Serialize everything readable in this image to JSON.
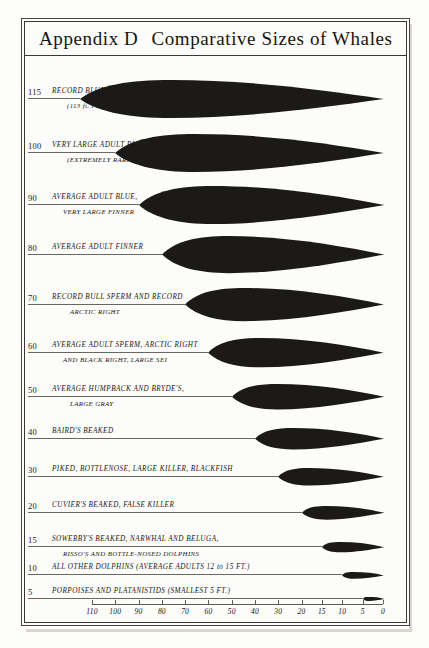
{
  "title": {
    "appendix": "Appendix D",
    "main": "Comparative Sizes of Whales"
  },
  "axis": {
    "ticks": [
      110,
      100,
      90,
      80,
      70,
      60,
      50,
      40,
      30,
      20,
      15,
      10,
      5,
      0
    ],
    "tick_labels": [
      "110",
      "100",
      "90",
      "80",
      "70",
      "60",
      "50",
      "40",
      "30",
      "20",
      "15",
      "10",
      "5",
      "0"
    ],
    "unit": "feet",
    "direction": "decreasing-left-to-right"
  },
  "chart_data": {
    "type": "bar",
    "xlabel": "",
    "ylabel": "",
    "orientation": "horizontal",
    "xlim": [
      120,
      0
    ],
    "grid": false,
    "legend": null,
    "note": "Horizontal whale silhouettes drawn to scale; each bar's length equals the animal's length in feet, aligned at the 0 ft right edge.",
    "categories": [
      "Record Blue",
      "Very Large Adult Blue",
      "Average Adult Blue, Very Large Finner",
      "Average Adult Finner",
      "Record Bull Sperm and Record Arctic Right",
      "Average Adult Sperm, Arctic Right and Black Right, Large Sei",
      "Average Humpback and Bryde's, Large Gray",
      "Baird's Beaked",
      "Piked, Bottlenose, Large Killer, Blackfish",
      "Cuvier's Beaked, False Killer",
      "Sowerby's Beaked, Narwhal and Beluga, Risso's and Bottle-nosed Dolphins",
      "All Other Dolphins",
      "Porpoises and Platanistids"
    ],
    "values": [
      115,
      100,
      90,
      80,
      70,
      60,
      50,
      40,
      30,
      20,
      15,
      10,
      5
    ],
    "rows": [
      {
        "value": 115,
        "tick": "115",
        "label_line1": "RECORD BLUE",
        "label_line2": "(113 ft. FEMALE)"
      },
      {
        "value": 100,
        "tick": "100",
        "label_line1": "VERY LARGE ADULT BLUE",
        "label_line2": "(EXTREMELY RARE)"
      },
      {
        "value": 90,
        "tick": "90",
        "label_line1": "AVERAGE ADULT BLUE,",
        "label_line2": "VERY LARGE FINNER"
      },
      {
        "value": 80,
        "tick": "80",
        "label_line1": "AVERAGE ADULT FINNER",
        "label_line2": ""
      },
      {
        "value": 70,
        "tick": "70",
        "label_line1": "RECORD BULL SPERM AND RECORD",
        "label_line2": "ARCTIC RIGHT"
      },
      {
        "value": 60,
        "tick": "60",
        "label_line1": "AVERAGE ADULT SPERM, ARCTIC RIGHT",
        "label_line2": "AND BLACK RIGHT, LARGE SEI"
      },
      {
        "value": 50,
        "tick": "50",
        "label_line1": "AVERAGE HUMPBACK AND BRYDE'S,",
        "label_line2": "LARGE GRAY"
      },
      {
        "value": 40,
        "tick": "40",
        "label_line1": "BAIRD'S BEAKED",
        "label_line2": ""
      },
      {
        "value": 30,
        "tick": "30",
        "label_line1": "PIKED, BOTTLENOSE, LARGE KILLER, BLACKFISH",
        "label_line2": ""
      },
      {
        "value": 20,
        "tick": "20",
        "label_line1": "CUVIER'S BEAKED, FALSE KILLER",
        "label_line2": ""
      },
      {
        "value": 15,
        "tick": "15",
        "label_line1": "SOWERBY'S BEAKED, NARWHAL AND BELUGA,",
        "label_line2": "RISSO'S AND BOTTLE-NOSED DOLPHINS"
      },
      {
        "value": 10,
        "tick": "10",
        "label_line1": "ALL OTHER DOLPHINS (AVERAGE ADULTS 12 to 15 FT.)",
        "label_line2": ""
      },
      {
        "value": 5,
        "tick": "5",
        "label_line1": "PORPOISES AND PLATANISTIDS (SMALLEST 5 FT.)",
        "label_line2": ""
      }
    ]
  },
  "colors": {
    "ink": "#1a1714",
    "silhouette": "#1c1a18",
    "rule": "#6b6660",
    "paper": "#fcfcfa",
    "frame": "#3a3632"
  }
}
